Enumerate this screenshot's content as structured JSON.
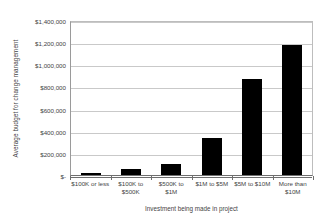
{
  "chart_data": {
    "type": "bar",
    "title": "",
    "xlabel": "Investment being made in project",
    "ylabel": "Average budget for change management",
    "categories": [
      "$100K or less",
      "$100K to $500K",
      "$500K to $1M",
      "$1M to $5M",
      "$5M to $10M",
      "More than $10M"
    ],
    "values": [
      15000,
      50000,
      100000,
      330000,
      865000,
      1170000
    ],
    "ylim": [
      0,
      1400000
    ],
    "ytick_values": [
      1400000,
      1200000,
      1000000,
      800000,
      600000,
      400000,
      200000,
      0
    ],
    "ytick_labels": [
      "$1,400,000",
      "$1,200,000",
      "$1,000,000",
      "$800,000",
      "$600,000",
      "$400,000",
      "$200,000",
      "$-"
    ],
    "grid": true,
    "legend": "none",
    "bar_color": "#000000",
    "gridline_color": "#c9c9c9",
    "axis_color": "#6e6e6e",
    "background_color": "#ffffff"
  }
}
